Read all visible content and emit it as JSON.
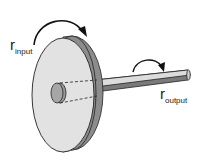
{
  "diagram": {
    "type": "wheel-and-axle",
    "labels": {
      "input": {
        "main": "r",
        "sub": "input"
      },
      "output": {
        "main": "r",
        "sub": "output"
      }
    },
    "parts": [
      "wheel",
      "wheel-rim",
      "hub",
      "axle",
      "input-rotation-arrow",
      "output-rotation-arrow"
    ],
    "colors": {
      "wheel_face": "#e2e2e2",
      "wheel_rim": "#8c8c8c",
      "hub": "#9a9a9a",
      "axle_top": "#dcdcdc",
      "axle_bottom": "#7a7a7a",
      "outline": "#222222"
    }
  }
}
